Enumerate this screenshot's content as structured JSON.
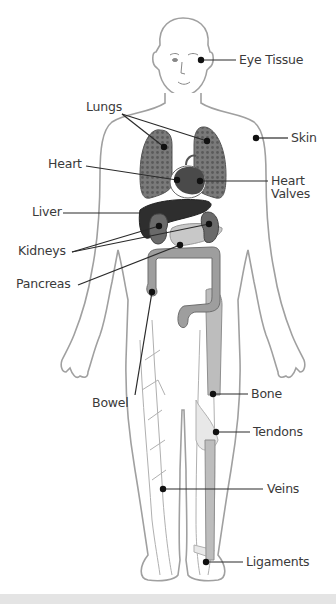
{
  "diagram": {
    "labels": {
      "eye_tissue": "Eye Tissue",
      "skin": "Skin",
      "lungs": "Lungs",
      "heart": "Heart",
      "heart_valves_line1": "Heart",
      "heart_valves_line2": "Valves",
      "liver": "Liver",
      "kidneys": "Kidneys",
      "pancreas": "Pancreas",
      "bowel": "Bowel",
      "bone": "Bone",
      "tendons": "Tendons",
      "veins": "Veins",
      "ligaments": "Ligaments"
    },
    "colors": {
      "outline": "#9a9a9a",
      "organ_dark": "#3c3c3c",
      "organ_mid": "#6e6e6e",
      "organ_light": "#b4b4b4",
      "label_text": "#3a3a3a",
      "leader_line": "#2a2a2a",
      "footer_strip": "#e4e4e4"
    }
  }
}
